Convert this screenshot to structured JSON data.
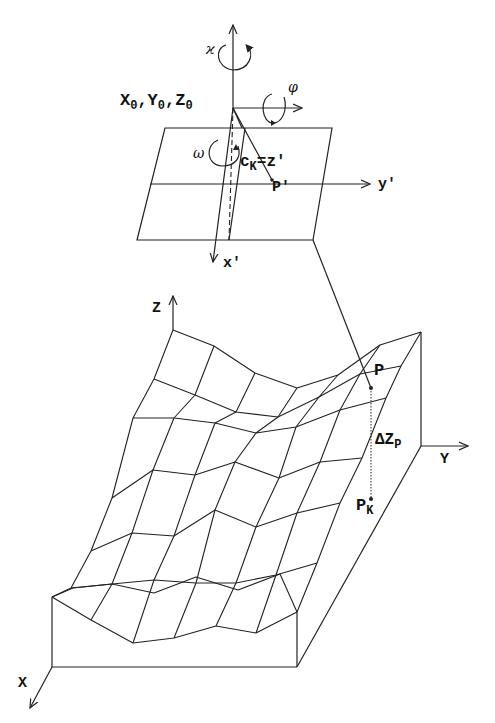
{
  "figure": {
    "projection_center": {
      "label_main": "X",
      "label_sub": "0",
      "full": "X0, Y0, Z0",
      "parts": [
        {
          "main": "X",
          "sub": "0"
        },
        {
          "main": "Y",
          "sub": "0"
        },
        {
          "main": "Z",
          "sub": "0"
        }
      ]
    },
    "rotations": {
      "kappa": "ϰ",
      "phi": "φ",
      "omega": "ω"
    },
    "image_plane": {
      "principal_distance": {
        "main": "c",
        "sub": "K",
        "suffix": "=z'"
      },
      "image_point": "P'",
      "axis_x": "x'",
      "axis_y": "y'"
    },
    "terrain": {
      "axis_x": "X",
      "axis_y": "Y",
      "axis_z": "Z",
      "surface_point": "P",
      "ground_point": {
        "main": "P",
        "sub": "K"
      },
      "height_diff": {
        "main": "ΔZ",
        "sub": "P"
      }
    }
  }
}
